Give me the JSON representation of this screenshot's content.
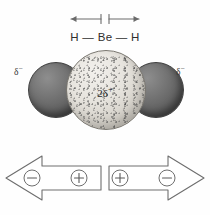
{
  "figure": {
    "background_color": "#fefefe",
    "line_color": "#5a5a5a"
  },
  "dipoles": {
    "left_arrow_name": "bond-dipole-arrow-left",
    "right_arrow_name": "bond-dipole-arrow-right",
    "direction_left": "left",
    "direction_right": "right"
  },
  "formula": {
    "text": "H — Be — H",
    "atoms": [
      "H",
      "Be",
      "H"
    ],
    "bond_symbol": "—"
  },
  "model": {
    "center_atom": "Be",
    "side_atoms": [
      "H",
      "H"
    ],
    "center_charge": "2δ",
    "center_charge_sign": "+",
    "left_charge": "δ",
    "left_charge_sign": "−",
    "right_charge": "δ",
    "right_charge_sign": "−",
    "center_color": "#e6e3dd",
    "side_color": "#6b6b6b"
  },
  "vectors": {
    "left": {
      "name": "dipole-vector-left",
      "points": "left",
      "tip_sign": "−",
      "tail_sign": "+"
    },
    "right": {
      "name": "dipole-vector-right",
      "points": "right",
      "tip_sign": "−",
      "tail_sign": "+"
    }
  }
}
